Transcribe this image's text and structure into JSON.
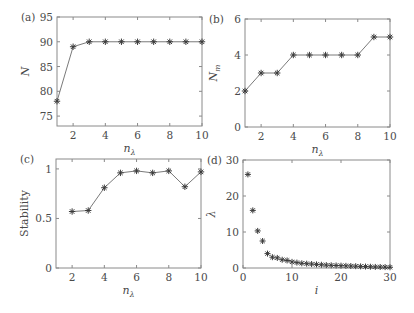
{
  "figure": {
    "width": 414,
    "height": 313,
    "colors": {
      "frame": "#8a8a8a",
      "line": "#7a7a7a",
      "marker": "#3a3a3a",
      "text": "#4a4a4a"
    }
  },
  "chart_data": [
    {
      "panel": "(a)",
      "type": "line",
      "marker": "asterisk",
      "x": [
        1,
        2,
        3,
        4,
        5,
        6,
        7,
        8,
        9,
        10
      ],
      "values": [
        78,
        89,
        90,
        90,
        90,
        90,
        90,
        90,
        90,
        90
      ],
      "xlabel": "n",
      "xlabel_sub": "λ",
      "ylabel": "N",
      "xlim": [
        1,
        10
      ],
      "ylim": [
        73,
        95
      ],
      "xticks": [
        2,
        4,
        6,
        8,
        10
      ],
      "yticks": [
        75,
        80,
        85,
        90,
        95
      ],
      "grid": false,
      "box": {
        "left": 57,
        "top": 17,
        "right": 202,
        "bottom": 126
      }
    },
    {
      "panel": "(b)",
      "type": "line",
      "marker": "asterisk",
      "x": [
        1,
        2,
        3,
        4,
        5,
        6,
        7,
        8,
        9,
        10
      ],
      "values": [
        2,
        3,
        3,
        4,
        4,
        4,
        4,
        4,
        5,
        5
      ],
      "xlabel": "n",
      "xlabel_sub": "λ",
      "ylabel": "N",
      "ylabel_sub": "m",
      "xlim": [
        1,
        10
      ],
      "ylim": [
        0,
        6
      ],
      "xticks": [
        2,
        4,
        6,
        8,
        10
      ],
      "yticks": [
        0,
        2,
        4,
        6
      ],
      "grid": false,
      "box": {
        "left": 245,
        "top": 19,
        "right": 390,
        "bottom": 127
      }
    },
    {
      "panel": "(c)",
      "type": "line",
      "marker": "asterisk",
      "x": [
        2,
        3,
        4,
        5,
        6,
        7,
        8,
        9,
        10
      ],
      "values": [
        0.57,
        0.58,
        0.81,
        0.96,
        0.98,
        0.96,
        0.98,
        0.82,
        0.97
      ],
      "xlabel": "n",
      "xlabel_sub": "λ",
      "ylabel": "Stability",
      "xlim": [
        1,
        10
      ],
      "ylim": [
        0,
        1.1
      ],
      "xticks": [
        2,
        4,
        6,
        8,
        10
      ],
      "yticks": [
        0,
        0.5,
        1
      ],
      "ytick_labels": [
        "0",
        "0.5",
        "1"
      ],
      "grid": false,
      "box": {
        "left": 56,
        "top": 159,
        "right": 201,
        "bottom": 268
      }
    },
    {
      "panel": "(d)",
      "type": "scatter",
      "marker": "asterisk",
      "x": [
        1,
        2,
        3,
        4,
        5,
        6,
        7,
        8,
        9,
        10,
        11,
        12,
        13,
        14,
        15,
        16,
        17,
        18,
        19,
        20,
        21,
        22,
        23,
        24,
        25,
        26,
        27,
        28,
        29,
        30
      ],
      "values": [
        26,
        16,
        10.3,
        7.5,
        4,
        3,
        2.8,
        2.3,
        2.1,
        1.7,
        1.5,
        1.3,
        1.2,
        1.1,
        1.0,
        0.9,
        0.8,
        0.75,
        0.7,
        0.65,
        0.6,
        0.55,
        0.5,
        0.45,
        0.4,
        0.35,
        0.3,
        0.28,
        0.25,
        0.2
      ],
      "xlabel": "i",
      "ylabel": "λ",
      "xlim": [
        0,
        30
      ],
      "ylim": [
        0,
        30
      ],
      "xticks": [
        0,
        10,
        20,
        30
      ],
      "yticks": [
        0,
        10,
        20,
        30
      ],
      "grid": false,
      "box": {
        "left": 243,
        "top": 160,
        "right": 390,
        "bottom": 268
      }
    }
  ]
}
